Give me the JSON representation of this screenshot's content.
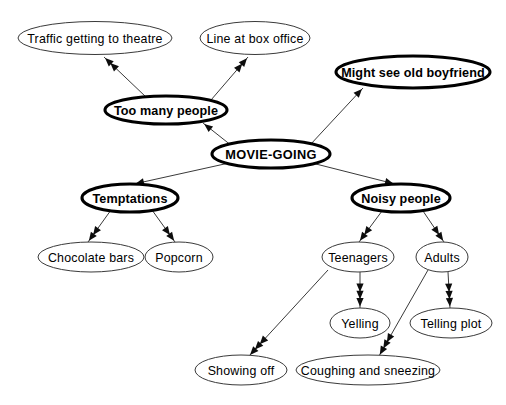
{
  "diagram": {
    "type": "concept-map",
    "background_color": "#ffffff",
    "line_color": "#3a3a3a",
    "text_color": "#000000",
    "nodes": [
      {
        "id": "traffic",
        "label": "Traffic getting to theatre",
        "emphasis": "normal",
        "cx": 95,
        "cy": 38,
        "rx": 77,
        "ry": 16.5
      },
      {
        "id": "line-box-office",
        "label": "Line at box office",
        "emphasis": "normal",
        "cx": 255,
        "cy": 38,
        "rx": 55,
        "ry": 16.5
      },
      {
        "id": "old-boyfriend",
        "label": "Might see old boyfriend",
        "emphasis": "bold",
        "cx": 413,
        "cy": 72,
        "rx": 77,
        "ry": 16
      },
      {
        "id": "too-many-people",
        "label": "Too many people",
        "emphasis": "bold",
        "cx": 166,
        "cy": 110,
        "rx": 61,
        "ry": 14
      },
      {
        "id": "movie-going",
        "label": "MOVIE-GOING",
        "emphasis": "root",
        "cx": 271,
        "cy": 154,
        "rx": 59,
        "ry": 14
      },
      {
        "id": "temptations",
        "label": "Temptations",
        "emphasis": "bold",
        "cx": 130,
        "cy": 198,
        "rx": 48,
        "ry": 14
      },
      {
        "id": "noisy-people",
        "label": "Noisy people",
        "emphasis": "bold",
        "cx": 401,
        "cy": 198,
        "rx": 49,
        "ry": 14
      },
      {
        "id": "chocolate-bars",
        "label": "Chocolate bars",
        "emphasis": "normal",
        "cx": 91,
        "cy": 257,
        "rx": 53,
        "ry": 15
      },
      {
        "id": "popcorn",
        "label": "Popcorn",
        "emphasis": "normal",
        "cx": 179,
        "cy": 257,
        "rx": 34,
        "ry": 15
      },
      {
        "id": "teenagers",
        "label": "Teenagers",
        "emphasis": "normal",
        "cx": 358,
        "cy": 257,
        "rx": 36,
        "ry": 15
      },
      {
        "id": "adults",
        "label": "Adults",
        "emphasis": "normal",
        "cx": 442,
        "cy": 257,
        "rx": 26,
        "ry": 15
      },
      {
        "id": "yelling",
        "label": "Yelling",
        "emphasis": "normal",
        "cx": 360,
        "cy": 323,
        "rx": 30,
        "ry": 15
      },
      {
        "id": "telling-plot",
        "label": "Telling plot",
        "emphasis": "normal",
        "cx": 451,
        "cy": 323,
        "rx": 41,
        "ry": 15
      },
      {
        "id": "showing-off",
        "label": "Showing off",
        "emphasis": "normal",
        "cx": 241,
        "cy": 370,
        "rx": 46,
        "ry": 15
      },
      {
        "id": "coughing-sneezing",
        "label": "Coughing and sneezing",
        "emphasis": "normal",
        "cx": 368,
        "cy": 370,
        "rx": 72,
        "ry": 15
      }
    ],
    "edges": [
      {
        "id": "too-many-people-to-traffic",
        "from": "too-many-people",
        "to": "traffic",
        "x1": 146,
        "y1": 97,
        "x2": 104,
        "y2": 57,
        "arrow_count": 2
      },
      {
        "id": "too-many-people-to-line-box-office",
        "from": "too-many-people",
        "to": "line-box-office",
        "x1": 211,
        "y1": 100,
        "x2": 248,
        "y2": 57,
        "arrow_count": 2
      },
      {
        "id": "movie-going-to-too-many-people",
        "from": "movie-going",
        "to": "too-many-people",
        "x1": 232,
        "y1": 146,
        "x2": 203,
        "y2": 123,
        "arrow_count": 1
      },
      {
        "id": "movie-going-to-old-boyfriend",
        "from": "movie-going",
        "to": "old-boyfriend",
        "x1": 310,
        "y1": 145,
        "x2": 363,
        "y2": 88,
        "arrow_count": 1
      },
      {
        "id": "movie-going-to-temptations",
        "from": "movie-going",
        "to": "temptations",
        "x1": 229,
        "y1": 163,
        "x2": 134,
        "y2": 184,
        "arrow_count": 1
      },
      {
        "id": "movie-going-to-noisy-people",
        "from": "movie-going",
        "to": "noisy-people",
        "x1": 312,
        "y1": 163,
        "x2": 395,
        "y2": 184,
        "arrow_count": 1
      },
      {
        "id": "temptations-to-chocolate-bars",
        "from": "temptations",
        "to": "chocolate-bars",
        "x1": 111,
        "y1": 210,
        "x2": 88,
        "y2": 242,
        "arrow_count": 2
      },
      {
        "id": "temptations-to-popcorn",
        "from": "temptations",
        "to": "popcorn",
        "x1": 152,
        "y1": 210,
        "x2": 175,
        "y2": 242,
        "arrow_count": 2
      },
      {
        "id": "noisy-people-to-teenagers",
        "from": "noisy-people",
        "to": "teenagers",
        "x1": 382,
        "y1": 211,
        "x2": 359,
        "y2": 242,
        "arrow_count": 2
      },
      {
        "id": "noisy-people-to-adults",
        "from": "noisy-people",
        "to": "adults",
        "x1": 423,
        "y1": 211,
        "x2": 444,
        "y2": 242,
        "arrow_count": 2
      },
      {
        "id": "teenagers-to-yelling",
        "from": "teenagers",
        "to": "yelling",
        "x1": 360,
        "y1": 272,
        "x2": 360,
        "y2": 308,
        "arrow_count": 3
      },
      {
        "id": "teenagers-to-showing-off",
        "from": "teenagers",
        "to": "showing-off",
        "x1": 328,
        "y1": 270,
        "x2": 249,
        "y2": 356,
        "arrow_count": 3
      },
      {
        "id": "adults-to-telling-plot",
        "from": "adults",
        "to": "telling-plot",
        "x1": 448,
        "y1": 272,
        "x2": 450,
        "y2": 308,
        "arrow_count": 3
      },
      {
        "id": "adults-to-coughing-sneezing",
        "from": "adults",
        "to": "coughing-sneezing",
        "x1": 428,
        "y1": 270,
        "x2": 379,
        "y2": 356,
        "arrow_count": 3
      }
    ]
  }
}
